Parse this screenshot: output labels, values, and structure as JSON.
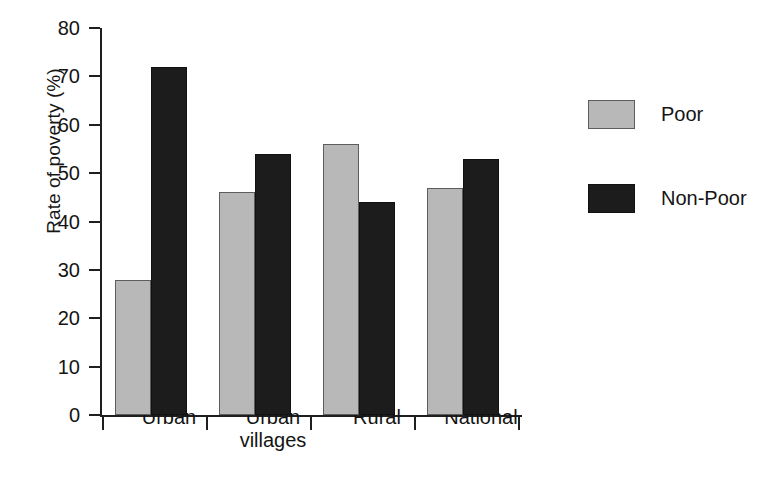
{
  "chart_data": {
    "type": "bar",
    "title": "",
    "subtitle": "",
    "xlabel": "",
    "ylabel": "Rate of poverty (%)",
    "categories": [
      "Urban",
      "Urban\nvillages",
      "Rural",
      "National"
    ],
    "series": [
      {
        "name": "Poor",
        "color": "#b8b8b8",
        "values": [
          28,
          46,
          56,
          47
        ]
      },
      {
        "name": "Non-Poor",
        "color": "#1c1c1c",
        "values": [
          72,
          54,
          44,
          53
        ]
      }
    ],
    "ylim": [
      0,
      80
    ],
    "ytick_labels": [
      "80",
      "70",
      "60",
      "50",
      "40",
      "30",
      "20",
      "10",
      "0"
    ],
    "ytick_values": [
      80,
      70,
      60,
      50,
      40,
      30,
      20,
      10,
      0
    ],
    "grid": false,
    "legend_position": "right",
    "bar_grouping": "grouped",
    "value_unit": "%"
  },
  "legend": {
    "entries": [
      {
        "label": "Poor",
        "swatch": "poor"
      },
      {
        "label": "Non-Poor",
        "swatch": "nonpoor"
      }
    ]
  },
  "caption": {
    "fragment": ""
  }
}
